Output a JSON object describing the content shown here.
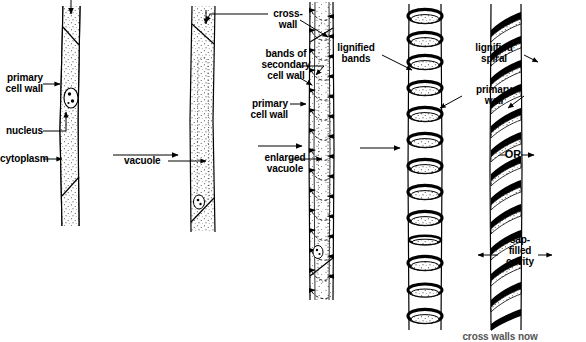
{
  "diagram": {
    "domain": "biological-diagram",
    "stage_count": 5,
    "ink_color": "#000000",
    "background_color": "#ffffff"
  },
  "labels": {
    "primary_cell_wall_left": "primary\ncell wall",
    "nucleus": "nucleus",
    "cytoplasm": "cytoplasm",
    "vacuole": "vacuole",
    "cross_wall": "cross-\nwall",
    "bands_of_secondary_cell_wall": "bands of\nsecondary\ncell wall",
    "primary_cell_wall_mid": "primary\ncell wall",
    "enlarged_vacuole": "enlarged\nvacuole",
    "lignified_bands": "lignified\nbands",
    "lignified_spiral": "lignified\nspiral",
    "primary_wall": "primary\nwall",
    "sap_filled_cavity": "sap-\nfilled\ncavity",
    "or_connector": "OR",
    "bottom_caption": "cross walls now"
  },
  "stages": [
    {
      "index": 1,
      "name": "young-cell",
      "features": [
        "primary cell wall",
        "nucleus",
        "cytoplasm",
        "cross walls"
      ]
    },
    {
      "index": 2,
      "name": "vacuolating-cell",
      "features": [
        "vacuole",
        "cross-wall",
        "primary cell wall"
      ]
    },
    {
      "index": 3,
      "name": "secondary-thickening-cell",
      "features": [
        "bands of secondary cell wall",
        "primary cell wall",
        "enlarged vacuole"
      ]
    },
    {
      "index": 4,
      "name": "annular-vessel",
      "features": [
        "lignified bands",
        "primary wall",
        "sap-filled cavity"
      ]
    },
    {
      "index": 5,
      "name": "spiral-vessel",
      "features": [
        "lignified spiral",
        "primary wall",
        "sap-filled cavity"
      ]
    }
  ],
  "arrows": [
    {
      "name": "arrow-stage1-to-stage2",
      "direction": "right"
    },
    {
      "name": "arrow-stage2-to-stage3",
      "direction": "right"
    },
    {
      "name": "arrow-stage3-to-stage4",
      "direction": "right"
    },
    {
      "name": "arrow-top-inflow",
      "direction": "down"
    },
    {
      "name": "arrow-or-connector",
      "direction": "right"
    }
  ]
}
